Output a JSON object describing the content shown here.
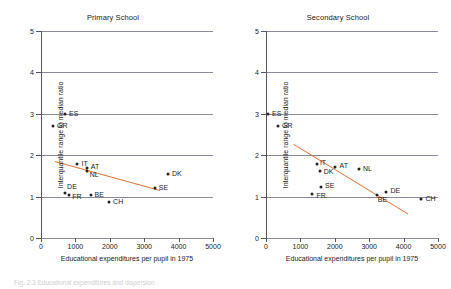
{
  "figure": {
    "caption_partial": "Fig. 2.3  Educational expenditures and dispersion"
  },
  "axes": {
    "xlabel": "Educational expenditures per pupil in 1975",
    "ylabel": "Interquantile range to median ratio",
    "xticks": [
      "0",
      "1000",
      "2000",
      "3000",
      "4000",
      "5000"
    ],
    "yticks": [
      "0",
      "1",
      "2",
      "3",
      "4",
      "5"
    ],
    "xlim": [
      0,
      5000
    ],
    "ylim": [
      0,
      5
    ]
  },
  "colors": {
    "trendline": "#e1773f",
    "grid": "#8a8a9a",
    "axis": "#555560",
    "marker": "#222228"
  },
  "chart_data": [
    {
      "type": "scatter",
      "title": "Primary School",
      "xlabel": "Educational expenditures per pupil in 1975",
      "ylabel": "Interquantile range to median ratio",
      "xlim": [
        0,
        5000
      ],
      "ylim": [
        0,
        5
      ],
      "grid": true,
      "legend": "none",
      "points": [
        {
          "label": "ES",
          "x": 700,
          "y": 3.0,
          "lx": 4,
          "ly": -4
        },
        {
          "label": "GR",
          "x": 350,
          "y": 2.7,
          "lx": 4,
          "ly": -4
        },
        {
          "label": "IT",
          "x": 1060,
          "y": 1.79,
          "lx": 4,
          "ly": -4
        },
        {
          "label": "AT",
          "x": 1330,
          "y": 1.7,
          "lx": 4,
          "ly": -5
        },
        {
          "label": "NL",
          "x": 1330,
          "y": 1.62,
          "lx": 3,
          "ly": 0
        },
        {
          "label": "DE",
          "x": 700,
          "y": 1.08,
          "lx": 2,
          "ly": -10
        },
        {
          "label": "FR",
          "x": 820,
          "y": 1.05,
          "lx": 3,
          "ly": -2
        },
        {
          "label": "BE",
          "x": 1440,
          "y": 1.04,
          "lx": 4,
          "ly": -4
        },
        {
          "label": "CH",
          "x": 1980,
          "y": 0.88,
          "lx": 4,
          "ly": -4
        },
        {
          "label": "DK",
          "x": 3690,
          "y": 1.55,
          "lx": 4,
          "ly": -4
        },
        {
          "label": "SE",
          "x": 3310,
          "y": 1.21,
          "lx": 4,
          "ly": -4
        }
      ],
      "trendline": {
        "x1": 400,
        "y1": 1.87,
        "x2": 3450,
        "y2": 1.17
      }
    },
    {
      "type": "scatter",
      "title": "Secondary School",
      "xlabel": "Educational expenditures per pupil in 1975",
      "ylabel": "Interquantile range to median ratio",
      "xlim": [
        0,
        5000
      ],
      "ylim": [
        0,
        5
      ],
      "grid": true,
      "legend": "none",
      "points": [
        {
          "label": "ES",
          "x": 60,
          "y": 3.0,
          "lx": 4,
          "ly": -4
        },
        {
          "label": "GR",
          "x": 350,
          "y": 2.7,
          "lx": 4,
          "ly": -4
        },
        {
          "label": "IT",
          "x": 1480,
          "y": 1.79,
          "lx": 3,
          "ly": -5
        },
        {
          "label": "AT",
          "x": 2020,
          "y": 1.72,
          "lx": 4,
          "ly": -5
        },
        {
          "label": "DK",
          "x": 1560,
          "y": 1.62,
          "lx": 4,
          "ly": -3
        },
        {
          "label": "NL",
          "x": 2700,
          "y": 1.67,
          "lx": 4,
          "ly": -4
        },
        {
          "label": "SE",
          "x": 1600,
          "y": 1.22,
          "lx": 4,
          "ly": -5
        },
        {
          "label": "FR",
          "x": 1350,
          "y": 1.07,
          "lx": 4,
          "ly": -2
        },
        {
          "label": "BE",
          "x": 3220,
          "y": 1.03,
          "lx": 1,
          "ly": 1
        },
        {
          "label": "DE",
          "x": 3500,
          "y": 1.11,
          "lx": 4,
          "ly": -5
        },
        {
          "label": "CH",
          "x": 4520,
          "y": 0.93,
          "lx": 4,
          "ly": -4
        }
      ],
      "trendline": {
        "x1": 800,
        "y1": 2.26,
        "x2": 4120,
        "y2": 0.58
      }
    }
  ]
}
